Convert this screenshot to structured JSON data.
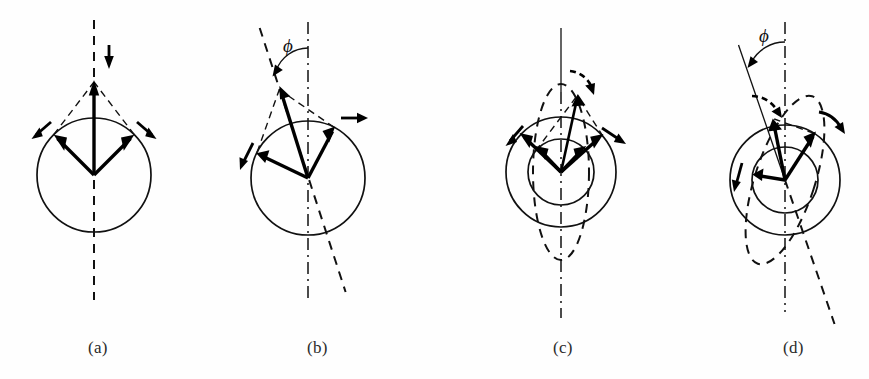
{
  "figure": {
    "width": 869,
    "height": 379,
    "background": "#fefefe",
    "ink": "#111111"
  },
  "panels": [
    {
      "id": "a",
      "caption": "(a)",
      "caption_x": 88,
      "caption_y": 338,
      "center": {
        "x": 94,
        "y": 175
      },
      "tilt_deg": 0,
      "circles": [
        {
          "name": "precession-cone-circle",
          "r": 57
        }
      ],
      "has_dashed_ellipse": false,
      "axis_style": "dashed",
      "axis_top_y": 20,
      "axis_bottom_y": 300,
      "angle_label": null,
      "vectors": [
        {
          "name": "left-component-vector",
          "angle_deg": 135,
          "length": 57,
          "style": "thick"
        },
        {
          "name": "right-component-vector",
          "angle_deg": 45,
          "length": 57,
          "style": "thick"
        },
        {
          "name": "resultant-vector",
          "angle_deg": 90,
          "length": 93,
          "style": "thick"
        }
      ],
      "dashed_construction": [
        {
          "name": "left-construction-line",
          "from_angle_deg": 135,
          "to": "resultant-tip"
        },
        {
          "name": "right-construction-line",
          "from_angle_deg": 45,
          "to": "resultant-tip"
        }
      ],
      "precession_arrows": [
        {
          "name": "left-precession-arrow",
          "at_angle_deg": 135,
          "direction": "down-left"
        },
        {
          "name": "right-precession-arrow",
          "at_angle_deg": 45,
          "direction": "down-right"
        },
        {
          "name": "resultant-precession-arrow",
          "at_angle_deg": 90,
          "direction": "down"
        }
      ]
    },
    {
      "id": "b",
      "caption": "(b)",
      "caption_x": 307,
      "caption_y": 338,
      "center": {
        "x": 308,
        "y": 178
      },
      "tilt_deg": 18,
      "circles": [
        {
          "name": "precession-cone-circle",
          "r": 57
        }
      ],
      "has_dashed_ellipse": false,
      "axis_style": "dashdot",
      "axis_top_y": 22,
      "axis_bottom_y": 300,
      "angle_label": {
        "symbol": "ϕ",
        "name": "phi-angle-label",
        "x": 269,
        "y": 42
      },
      "vectors": [
        {
          "name": "left-component-vector",
          "angle_deg": 153,
          "length": 57,
          "style": "thick"
        },
        {
          "name": "right-component-vector",
          "angle_deg": 63,
          "length": 57,
          "style": "thick"
        },
        {
          "name": "resultant-vector",
          "angle_deg": 108,
          "length": 93,
          "style": "thick"
        }
      ],
      "dashed_construction": [
        {
          "name": "left-construction-line",
          "from_angle_deg": 153,
          "to": "resultant-tip"
        },
        {
          "name": "right-construction-line",
          "from_angle_deg": 63,
          "to": "resultant-tip"
        }
      ],
      "precession_arrows": [
        {
          "name": "left-precession-arrow",
          "at_angle_deg": 153,
          "direction": "down-left"
        },
        {
          "name": "right-precession-arrow",
          "at_angle_deg": 63,
          "direction": "right"
        }
      ],
      "tilted_axis": {
        "name": "tilted-symmetry-axis",
        "style": "dashed",
        "tilt_deg": 18
      }
    },
    {
      "id": "c",
      "caption": "(c)",
      "caption_x": 553,
      "caption_y": 338,
      "center": {
        "x": 561,
        "y": 172
      },
      "tilt_deg": 0,
      "circles": [
        {
          "name": "outer-precession-circle",
          "r": 55
        },
        {
          "name": "inner-precession-circle",
          "r": 33
        }
      ],
      "has_dashed_ellipse": true,
      "dashed_ellipse": {
        "name": "vertical-precession-ellipse",
        "rx": 28,
        "ry": 88
      },
      "axis_style": "solid-dashdot",
      "axis_top_y": 28,
      "axis_bottom_y": 318,
      "angle_label": null,
      "vectors": [
        {
          "name": "left-component-vector",
          "angle_deg": 140,
          "length": 33,
          "style": "thick"
        },
        {
          "name": "right-component-vector",
          "angle_deg": 40,
          "length": 33,
          "style": "thick"
        },
        {
          "name": "outer-left-vector",
          "angle_deg": 140,
          "length": 55,
          "style": "thick"
        },
        {
          "name": "outer-right-vector",
          "angle_deg": 40,
          "length": 55,
          "style": "thick"
        },
        {
          "name": "resultant-vector",
          "angle_deg": 78,
          "length": 78,
          "style": "thin"
        }
      ],
      "dashed_construction": [
        {
          "name": "left-construction-line",
          "from_angle_deg": 140,
          "to": "resultant-tip"
        },
        {
          "name": "right-construction-line",
          "from_angle_deg": 40,
          "to": "resultant-tip"
        }
      ],
      "precession_arrows": [
        {
          "name": "left-precession-arrow",
          "at_angle_deg": 140,
          "direction": "down-left"
        },
        {
          "name": "right-precession-arrow",
          "at_angle_deg": 40,
          "direction": "down-right"
        },
        {
          "name": "resultant-precession-arrow",
          "at_angle_deg": 78,
          "direction": "down-right"
        }
      ]
    },
    {
      "id": "d",
      "caption": "(d)",
      "caption_x": 783,
      "caption_y": 338,
      "center": {
        "x": 785,
        "y": 180
      },
      "tilt_deg": 18,
      "circles": [
        {
          "name": "outer-precession-circle",
          "r": 55
        },
        {
          "name": "inner-precession-circle",
          "r": 33
        }
      ],
      "has_dashed_ellipse": true,
      "dashed_ellipse": {
        "name": "tilted-precession-ellipse",
        "rx": 30,
        "ry": 88,
        "tilt_deg": 18
      },
      "axis_style": "dashdot",
      "axis_top_y": 22,
      "axis_bottom_y": 312,
      "angle_label": {
        "symbol": "ϕ",
        "name": "phi-angle-label",
        "x": 775,
        "y": 40
      },
      "vectors": [
        {
          "name": "left-component-vector",
          "angle_deg": 172,
          "length": 33,
          "style": "thick"
        },
        {
          "name": "right-component-vector",
          "angle_deg": 58,
          "length": 55,
          "style": "thick"
        },
        {
          "name": "resultant-vector",
          "angle_deg": 100,
          "length": 62,
          "style": "thick"
        }
      ],
      "dashed_construction": [
        {
          "name": "right-construction-line",
          "from_angle_deg": 58,
          "to": "resultant-tip"
        }
      ],
      "precession_arrows": [
        {
          "name": "left-precession-arrow",
          "at_angle_deg": 172,
          "direction": "down-left"
        },
        {
          "name": "right-precession-arrow",
          "at_angle_deg": 58,
          "direction": "right"
        },
        {
          "name": "resultant-precession-arrow",
          "at_angle_deg": 100,
          "direction": "down-right"
        }
      ],
      "tilted_axis": {
        "name": "tilted-symmetry-axis",
        "style": "dashed",
        "tilt_deg": 18
      }
    }
  ]
}
